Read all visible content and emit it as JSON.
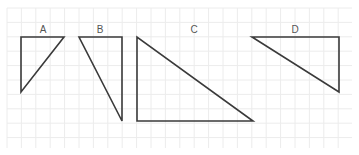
{
  "canvas": {
    "width": 359,
    "height": 155,
    "background": "#ffffff"
  },
  "grid": {
    "x0": 7,
    "y0": 8,
    "x1": 352,
    "y1": 148,
    "spacing": 14.4,
    "color": "#ececec"
  },
  "stroke_color": "#3a3a3a",
  "triangles": [
    {
      "label": "A",
      "label_pos": [
        43,
        33
      ],
      "points": [
        [
          21,
          37
        ],
        [
          64,
          37
        ],
        [
          21,
          92
        ]
      ]
    },
    {
      "label": "B",
      "label_pos": [
        100,
        33
      ],
      "points": [
        [
          79,
          37
        ],
        [
          122,
          37
        ],
        [
          122,
          121
        ]
      ]
    },
    {
      "label": "C",
      "label_pos": [
        194,
        33
      ],
      "points": [
        [
          137,
          37
        ],
        [
          137,
          121
        ],
        [
          253,
          121
        ]
      ]
    },
    {
      "label": "D",
      "label_pos": [
        295,
        33
      ],
      "points": [
        [
          252,
          37
        ],
        [
          339,
          37
        ],
        [
          339,
          92
        ]
      ]
    }
  ]
}
